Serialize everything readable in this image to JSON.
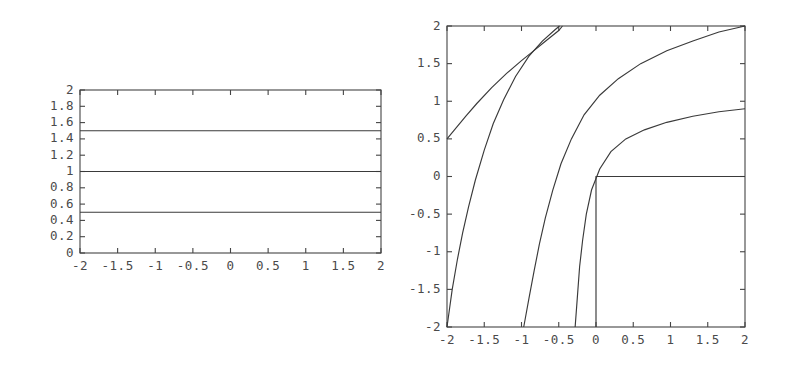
{
  "figure": {
    "background": "#ffffff",
    "line_color": "#3a3a3a",
    "axis_color": "#444444",
    "panel_count": 2
  },
  "chart_data": [
    {
      "id": "left-panel",
      "type": "line",
      "title": "",
      "xlabel": "",
      "ylabel": "",
      "xlim": [
        -2,
        2
      ],
      "ylim": [
        0,
        2
      ],
      "grid": false,
      "legend": null,
      "xticks": [
        -2,
        -1.5,
        -1,
        -0.5,
        0,
        0.5,
        1,
        1.5,
        2
      ],
      "xticklabels": [
        "-2",
        "-1.5",
        "-1",
        "-0.5",
        "0",
        "0.5",
        "1",
        "1.5",
        "2"
      ],
      "yticks": [
        0,
        0.2,
        0.4,
        0.6,
        0.8,
        1,
        1.2,
        1.4,
        1.6,
        1.8,
        2
      ],
      "yticklabels": [
        "0",
        "0.2",
        "0.4",
        "0.6",
        "0.8",
        "1",
        "1.2",
        "1.4",
        "1.6",
        "1.8",
        "2"
      ],
      "series": [
        {
          "name": "level-1.5",
          "constant_y": 1.5,
          "x": [
            -2,
            -1.5,
            -1,
            -0.5,
            0,
            0.5,
            1,
            1.5,
            2
          ],
          "values": [
            1.5,
            1.5,
            1.5,
            1.5,
            1.5,
            1.5,
            1.5,
            1.5,
            1.5
          ]
        },
        {
          "name": "level-1.0",
          "constant_y": 1.0,
          "x": [
            -2,
            -1.5,
            -1,
            -0.5,
            0,
            0.5,
            1,
            1.5,
            2
          ],
          "values": [
            1.0,
            1.0,
            1.0,
            1.0,
            1.0,
            1.0,
            1.0,
            1.0,
            1.0
          ]
        },
        {
          "name": "level-0.5",
          "constant_y": 0.5,
          "x": [
            -2,
            -1.5,
            -1,
            -0.5,
            0,
            0.5,
            1,
            1.5,
            2
          ],
          "values": [
            0.5,
            0.5,
            0.5,
            0.5,
            0.5,
            0.5,
            0.5,
            0.5,
            0.5
          ]
        }
      ]
    },
    {
      "id": "right-panel",
      "type": "line",
      "title": "",
      "xlabel": "",
      "ylabel": "",
      "xlim": [
        -2,
        2
      ],
      "ylim": [
        -2,
        2
      ],
      "grid": false,
      "legend": null,
      "xticks": [
        -2,
        -1.5,
        -1,
        -0.5,
        0,
        0.5,
        1,
        1.5,
        2
      ],
      "xticklabels": [
        "-2",
        "-1.5",
        "-1",
        "-0.5",
        "0",
        "0.5",
        "1",
        "1.5",
        "2"
      ],
      "yticks": [
        -2,
        -1.5,
        -1,
        -0.5,
        0,
        0.5,
        1,
        1.5,
        2
      ],
      "yticklabels": [
        "-2",
        "-1.5",
        "-1",
        "-0.5",
        "0",
        "0.5",
        "1",
        "1.5",
        "2"
      ],
      "series": [
        {
          "name": "contour-a",
          "points": [
            [
              -2,
              -2
            ],
            [
              -1.93,
              -1.5
            ],
            [
              -1.86,
              -1.1
            ],
            [
              -1.79,
              -0.75
            ],
            [
              -1.71,
              -0.4
            ],
            [
              -1.62,
              -0.05
            ],
            [
              -1.5,
              0.35
            ],
            [
              -1.38,
              0.7
            ],
            [
              -1.24,
              1.02
            ],
            [
              -1.08,
              1.33
            ],
            [
              -0.9,
              1.6
            ],
            [
              -0.72,
              1.8
            ],
            [
              -0.55,
              1.95
            ],
            [
              -0.49,
              2.0
            ]
          ]
        },
        {
          "name": "contour-b",
          "points": [
            [
              -2,
              0.5
            ],
            [
              -1.9,
              0.62
            ],
            [
              -1.75,
              0.8
            ],
            [
              -1.6,
              0.97
            ],
            [
              -1.4,
              1.18
            ],
            [
              -1.2,
              1.37
            ],
            [
              -1.0,
              1.54
            ],
            [
              -0.85,
              1.66
            ],
            [
              -0.7,
              1.78
            ],
            [
              -0.6,
              1.86
            ],
            [
              -0.5,
              1.94
            ],
            [
              -0.45,
              2.0
            ]
          ]
        },
        {
          "name": "contour-c",
          "points": [
            [
              -0.97,
              -2
            ],
            [
              -0.9,
              -1.62
            ],
            [
              -0.83,
              -1.25
            ],
            [
              -0.76,
              -0.9
            ],
            [
              -0.68,
              -0.55
            ],
            [
              -0.58,
              -0.18
            ],
            [
              -0.47,
              0.17
            ],
            [
              -0.33,
              0.5
            ],
            [
              -0.16,
              0.82
            ],
            [
              0.05,
              1.08
            ],
            [
              0.3,
              1.3
            ],
            [
              0.6,
              1.5
            ],
            [
              0.95,
              1.67
            ],
            [
              1.3,
              1.8
            ],
            [
              1.65,
              1.92
            ],
            [
              2,
              2
            ]
          ]
        },
        {
          "name": "contour-d",
          "points": [
            [
              -0.28,
              -2
            ],
            [
              -0.25,
              -1.6
            ],
            [
              -0.22,
              -1.2
            ],
            [
              -0.18,
              -0.85
            ],
            [
              -0.13,
              -0.5
            ],
            [
              -0.06,
              -0.18
            ],
            [
              0.05,
              0.1
            ],
            [
              0.2,
              0.33
            ],
            [
              0.4,
              0.5
            ],
            [
              0.65,
              0.62
            ],
            [
              0.95,
              0.72
            ],
            [
              1.3,
              0.8
            ],
            [
              1.65,
              0.86
            ],
            [
              2,
              0.9
            ]
          ]
        },
        {
          "name": "contour-corner",
          "points": [
            [
              0,
              -2
            ],
            [
              0,
              0
            ],
            [
              2,
              0
            ]
          ]
        }
      ]
    }
  ]
}
